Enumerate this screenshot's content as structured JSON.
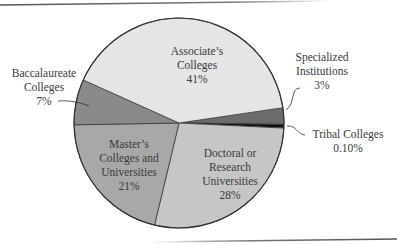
{
  "chart_data": {
    "type": "pie",
    "title": "",
    "categories": [
      "Specialized Institutions",
      "Tribal Colleges",
      "Doctoral or Research Universities",
      "Master's Colleges and Universities",
      "Baccalaureate Colleges",
      "Associate's Colleges"
    ],
    "values": [
      3,
      0.1,
      28,
      21,
      7,
      41
    ],
    "value_labels": [
      "3%",
      "0.10%",
      "28%",
      "21%",
      "7%",
      "41%"
    ],
    "colors": [
      "#6b6b6b",
      "#111111",
      "#c6c6c6",
      "#a8a8a8",
      "#8a8a8a",
      "#e5e5e5"
    ],
    "legend": "none (direct labels with leader lines)"
  },
  "labels": {
    "associates": {
      "line1": "Associate’s",
      "line2": "Colleges",
      "pct": "41%"
    },
    "baccalaureate": {
      "line1": "Baccalaureate",
      "line2": "Colleges",
      "pct": "7%"
    },
    "specialized": {
      "line1": "Specialized",
      "line2": "Institutions",
      "pct": "3%"
    },
    "tribal": {
      "line1": "Tribal Colleges",
      "pct": "0.10%"
    },
    "masters": {
      "line1": "Master’s",
      "line2": "Colleges and",
      "line3": "Universities",
      "pct": "21%"
    },
    "doctoral": {
      "line1": "Doctoral or",
      "line2": "Research",
      "line3": "Universities",
      "pct": "28%"
    }
  }
}
